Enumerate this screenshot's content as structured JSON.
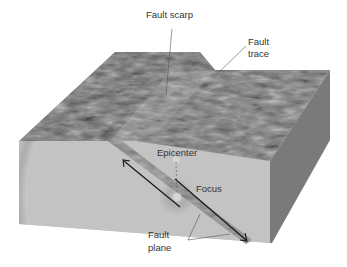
{
  "diagram": {
    "type": "fault block diagram",
    "labels": {
      "fault_scarp": "Fault scarp",
      "fault_trace_1": "Fault",
      "fault_trace_2": "trace",
      "epicenter": "Epicenter",
      "focus": "Focus",
      "fault_plane_1": "Fault",
      "fault_plane_2": "plane"
    },
    "colors": {
      "top_surface": "#6e6e6e",
      "front_face": "#bdbdbd",
      "side_face": "#7a7a7a",
      "arrow": "#1a1a1a",
      "leader_line": "#555555",
      "text": "#333333"
    }
  }
}
